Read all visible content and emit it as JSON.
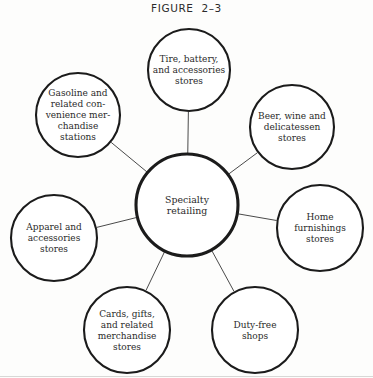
{
  "figure": {
    "title": "FIGURE  2–3",
    "kind": "hub-and-spoke concept map",
    "background_color": "#fdfdfc",
    "line_color": "#1b1b1b"
  },
  "hub": {
    "id": "specialty-retailing",
    "lines": [
      "Specialty",
      "retailing"
    ],
    "cx": 187,
    "cy": 205,
    "r": 51
  },
  "satellites": [
    {
      "id": "tire-battery-accessories-stores",
      "lines": [
        "Tire, battery,",
        "and accessories",
        "stores"
      ],
      "cx": 189,
      "cy": 70,
      "r": 41
    },
    {
      "id": "beer-wine-delicatessen-stores",
      "lines": [
        "Beer, wine and",
        "delicatessen",
        "stores"
      ],
      "cx": 292,
      "cy": 127,
      "r": 42
    },
    {
      "id": "home-furnishings-stores",
      "lines": [
        "Home",
        "furnishings",
        "stores"
      ],
      "cx": 320,
      "cy": 228,
      "r": 43
    },
    {
      "id": "duty-free-shops",
      "lines": [
        "Duty-free",
        "shops"
      ],
      "cx": 255,
      "cy": 330,
      "r": 43
    },
    {
      "id": "cards-gifts-related-merchandise-stores",
      "lines": [
        "Cards, gifts,",
        "and related",
        "merchandise",
        "stores"
      ],
      "cx": 127,
      "cy": 330,
      "r": 43
    },
    {
      "id": "apparel-and-accessories-stores",
      "lines": [
        "Apparel and",
        "accessories",
        "stores"
      ],
      "cx": 54,
      "cy": 238,
      "r": 43
    },
    {
      "id": "gasoline-related-convenience-merchandise-stations",
      "lines": [
        "Gasoline and",
        "related con-",
        "venience mer-",
        "chandise",
        "stations"
      ],
      "cx": 78,
      "cy": 115,
      "r": 42
    }
  ]
}
